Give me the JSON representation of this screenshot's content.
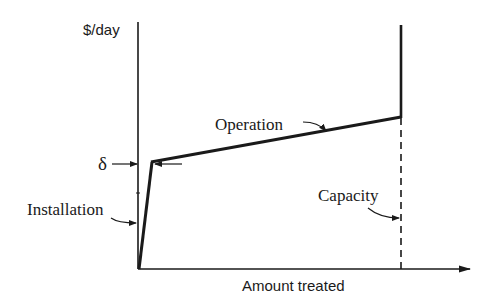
{
  "diagram": {
    "y_axis_label": "$/day",
    "x_axis_label": "Amount treated",
    "labels": {
      "operation": "Operation",
      "installation": "Installation",
      "capacity": "Capacity",
      "delta": "δ"
    },
    "colors": {
      "ink": "#1a1a1a",
      "background": "#ffffff"
    }
  }
}
